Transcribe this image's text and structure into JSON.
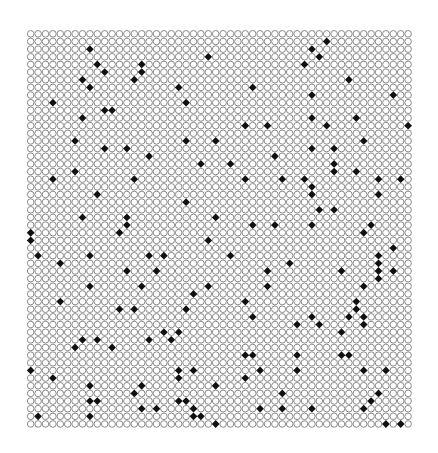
{
  "figure": {
    "columns": 52,
    "rows": 52,
    "pitch_x": 7.4,
    "pitch_y": 7.65,
    "circle_stroke_color": "#8a8a8a",
    "circle_fill_color": "#ffffff",
    "dot_color": "#111111",
    "filled_cells": [
      [
        8,
        2
      ],
      [
        9,
        4
      ],
      [
        10,
        5
      ],
      [
        7,
        6
      ],
      [
        8,
        7
      ],
      [
        15,
        4
      ],
      [
        15,
        5
      ],
      [
        14,
        6
      ],
      [
        24,
        3
      ],
      [
        20,
        7
      ],
      [
        21,
        9
      ],
      [
        3,
        9
      ],
      [
        10,
        10
      ],
      [
        11,
        10
      ],
      [
        7,
        11
      ],
      [
        40,
        1
      ],
      [
        38,
        2
      ],
      [
        39,
        3
      ],
      [
        37,
        4
      ],
      [
        43,
        6
      ],
      [
        30,
        7
      ],
      [
        38,
        8
      ],
      [
        49,
        8
      ],
      [
        38,
        11
      ],
      [
        44,
        11
      ],
      [
        29,
        12
      ],
      [
        40,
        12
      ],
      [
        32,
        12
      ],
      [
        51,
        12
      ],
      [
        6,
        14
      ],
      [
        10,
        15
      ],
      [
        13,
        15
      ],
      [
        16,
        16
      ],
      [
        21,
        14
      ],
      [
        25,
        14
      ],
      [
        23,
        17
      ],
      [
        6,
        18
      ],
      [
        3,
        19
      ],
      [
        14,
        19
      ],
      [
        9,
        21
      ],
      [
        21,
        22
      ],
      [
        7,
        24
      ],
      [
        13,
        24
      ],
      [
        25,
        24
      ],
      [
        45,
        14
      ],
      [
        38,
        15
      ],
      [
        41,
        15
      ],
      [
        33,
        16
      ],
      [
        27,
        17
      ],
      [
        41,
        17
      ],
      [
        41,
        18
      ],
      [
        44,
        18
      ],
      [
        29,
        19
      ],
      [
        34,
        19
      ],
      [
        37,
        19
      ],
      [
        47,
        19
      ],
      [
        50,
        19
      ],
      [
        38,
        20
      ],
      [
        38,
        21
      ],
      [
        47,
        21
      ],
      [
        39,
        23
      ],
      [
        41,
        23
      ],
      [
        13,
        25
      ],
      [
        0,
        26
      ],
      [
        0,
        27
      ],
      [
        12,
        26
      ],
      [
        24,
        27
      ],
      [
        1,
        29
      ],
      [
        8,
        29
      ],
      [
        16,
        29
      ],
      [
        18,
        29
      ],
      [
        4,
        30
      ],
      [
        13,
        31
      ],
      [
        17,
        31
      ],
      [
        8,
        33
      ],
      [
        15,
        33
      ],
      [
        24,
        33
      ],
      [
        22,
        34
      ],
      [
        4,
        35
      ],
      [
        30,
        25
      ],
      [
        33,
        25
      ],
      [
        38,
        25
      ],
      [
        46,
        25
      ],
      [
        45,
        26
      ],
      [
        49,
        28
      ],
      [
        27,
        29
      ],
      [
        47,
        29
      ],
      [
        47,
        30
      ],
      [
        47,
        31
      ],
      [
        47,
        32
      ],
      [
        49,
        31
      ],
      [
        35,
        30
      ],
      [
        32,
        31
      ],
      [
        42,
        31
      ],
      [
        32,
        33
      ],
      [
        45,
        33
      ],
      [
        29,
        35
      ],
      [
        44,
        35
      ],
      [
        12,
        36
      ],
      [
        14,
        36
      ],
      [
        21,
        36
      ],
      [
        18,
        39
      ],
      [
        20,
        39
      ],
      [
        7,
        40
      ],
      [
        9,
        40
      ],
      [
        16,
        40
      ],
      [
        19,
        40
      ],
      [
        6,
        41
      ],
      [
        11,
        41
      ],
      [
        0,
        44
      ],
      [
        20,
        44
      ],
      [
        22,
        44
      ],
      [
        3,
        45
      ],
      [
        20,
        45
      ],
      [
        8,
        46
      ],
      [
        15,
        46
      ],
      [
        25,
        46
      ],
      [
        14,
        47
      ],
      [
        8,
        48
      ],
      [
        9,
        48
      ],
      [
        20,
        48
      ],
      [
        21,
        48
      ],
      [
        15,
        49
      ],
      [
        17,
        49
      ],
      [
        22,
        49
      ],
      [
        1,
        50
      ],
      [
        8,
        50
      ],
      [
        22,
        50
      ],
      [
        23,
        50
      ],
      [
        25,
        51
      ],
      [
        44,
        36
      ],
      [
        30,
        37
      ],
      [
        38,
        37
      ],
      [
        43,
        37
      ],
      [
        45,
        37
      ],
      [
        45,
        38
      ],
      [
        36,
        38
      ],
      [
        39,
        38
      ],
      [
        42,
        39
      ],
      [
        29,
        42
      ],
      [
        30,
        42
      ],
      [
        36,
        42
      ],
      [
        42,
        42
      ],
      [
        43,
        42
      ],
      [
        31,
        44
      ],
      [
        36,
        44
      ],
      [
        45,
        44
      ],
      [
        48,
        44
      ],
      [
        29,
        45
      ],
      [
        34,
        47
      ],
      [
        47,
        47
      ],
      [
        46,
        48
      ],
      [
        31,
        49
      ],
      [
        34,
        49
      ],
      [
        38,
        49
      ],
      [
        45,
        49
      ],
      [
        48,
        51
      ],
      [
        50,
        51
      ]
    ]
  }
}
